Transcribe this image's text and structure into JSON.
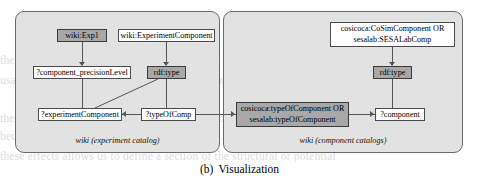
{
  "figure": {
    "caption_number": "(b)",
    "caption_text": "Visualization"
  },
  "panels": [
    {
      "id": "experiment-catalog",
      "caption": "wiki (experiment catalog)"
    },
    {
      "id": "component-catalogs",
      "caption": "wiki (component catalogs)"
    }
  ],
  "nodes": {
    "wiki_exp1": "wiki:Exp1",
    "wiki_experiment_component": "wiki:ExperimentComponent",
    "component_precision_level": "?component_precisionLevel",
    "rdf_type_left": "rdf:type",
    "experiment_component_var": "?experimentComponent",
    "type_of_comp_var": "?typeOfComp",
    "cosim_component_class_line1": "cosicoca:CoSimComponent OR",
    "cosim_component_class_line2": "sesalab:SESALabComp",
    "rdf_type_right": "rdf:type",
    "type_of_component_pred_line1": "cosicoca:typeOfComponent OR",
    "type_of_component_pred_line2": "sesalab:typeOfComponent",
    "component_var": "?component"
  },
  "style": {
    "panel_fill": "#e2e2e2",
    "panel_border": "#6a6a6a",
    "node_fill": "#ffffff",
    "node_fill_highlight": "#a8a8a8",
    "node_border": "#4a4a4a",
    "edge_color": "#555555",
    "page_background": "#ffffff"
  },
  "bleed_text": {
    "line1": "the CPU-bound components of the simulation are pinned to a dedicated CPU core",
    "line2": "usable components ... the ontology ... and so on",
    "line3": "the component ... using the union of the possible classes that the DSL supports",
    "line4": "because the component catalogs are separate ... the query has to be run on the third",
    "line5": "these effects allows us to define a section of the structural or potential"
  }
}
